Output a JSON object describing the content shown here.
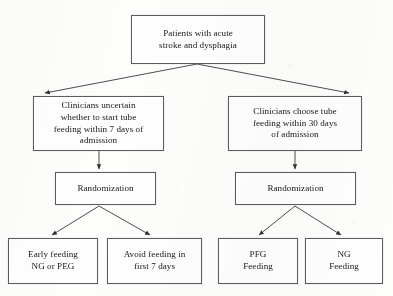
{
  "diagram": {
    "style": {
      "box_border_color": "#5c5c5c",
      "box_fill_color": "#fefefe",
      "text_color": "#171717",
      "connector_color": "#3a3a3a",
      "page_background": "#fdfdfc"
    },
    "nodes": {
      "top": {
        "label": "Patients with acute\nstroke and dysphagia"
      },
      "mid_left": {
        "label": "Clinicians uncertain\nwhether to start tube\nfeeding within 7 days of\nadmission"
      },
      "mid_right": {
        "label": "Clinicians choose tube\nfeeding within 30 days\nof admission"
      },
      "rand_left": {
        "label": "Randomization"
      },
      "rand_right": {
        "label": "Randomization"
      },
      "out_1": {
        "label": "Early feeding\nNG or PEG"
      },
      "out_2": {
        "label": "Avoid feeding in\nfirst 7 days"
      },
      "out_3": {
        "label": "PFG\nFeeding"
      },
      "out_4": {
        "label": "NG\nFeeding"
      }
    },
    "connectors": [
      {
        "from": "top",
        "to": "mid_left",
        "type": "diagonal-arrow"
      },
      {
        "from": "top",
        "to": "mid_right",
        "type": "diagonal-arrow"
      },
      {
        "from": "mid_left",
        "to": "rand_left",
        "type": "vertical-arrow"
      },
      {
        "from": "mid_right",
        "to": "rand_right",
        "type": "vertical-arrow"
      },
      {
        "from": "rand_left",
        "to": "out_1",
        "type": "diagonal-arrow"
      },
      {
        "from": "rand_left",
        "to": "out_2",
        "type": "diagonal-arrow"
      },
      {
        "from": "rand_right",
        "to": "out_3",
        "type": "diagonal-arrow"
      },
      {
        "from": "rand_right",
        "to": "out_4",
        "type": "diagonal-arrow"
      }
    ]
  }
}
